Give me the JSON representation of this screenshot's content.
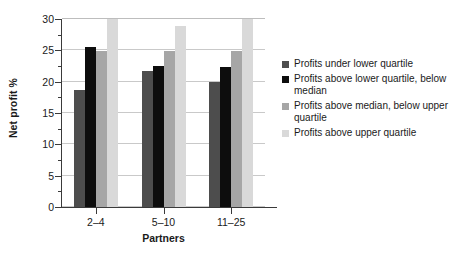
{
  "chart_data": {
    "type": "bar",
    "title": "",
    "subtitle": "",
    "xlabel": "Partners",
    "ylabel": "Net profit %",
    "categories": [
      "2–4",
      "5–10",
      "11–25"
    ],
    "ylim": [
      0,
      30
    ],
    "yticks": [
      0,
      5,
      10,
      15,
      20,
      25,
      30
    ],
    "ytick_labels": [
      "0",
      "5",
      "10",
      "15",
      "20",
      "25",
      "30"
    ],
    "yminor_ticks": [
      2.5,
      7.5,
      12.5,
      17.5,
      22.5,
      27.5
    ],
    "grid": true,
    "grid_axis": "y",
    "legend_position": "right",
    "series": [
      {
        "name": "Profits under lower quartile",
        "color": "#4d4d4d",
        "values": [
          18.6,
          21.7,
          19.9
        ],
        "clipped": [
          false,
          false,
          false
        ]
      },
      {
        "name": "Profits above lower quartile, below median",
        "color": "#0d0d0d",
        "values": [
          25.6,
          22.5,
          22.4
        ],
        "clipped": [
          false,
          false,
          false
        ]
      },
      {
        "name": "Profits above median, below upper quartile",
        "color": "#a6a6a6",
        "values": [
          24.9,
          24.9,
          24.9
        ],
        "clipped": [
          false,
          false,
          false
        ]
      },
      {
        "name": "Profits above upper quartile",
        "color": "#d9d9d9",
        "values": [
          30.0,
          28.9,
          30.0
        ],
        "clipped": [
          true,
          false,
          true
        ]
      }
    ]
  },
  "legend": {
    "entries": [
      {
        "label": "Profits under lower quartile",
        "color": "#4d4d4d"
      },
      {
        "label": "Profits above lower quartile, below median",
        "color": "#0d0d0d"
      },
      {
        "label": "Profits above median, below upper quartile",
        "color": "#a6a6a6"
      },
      {
        "label": "Profits above upper quartile",
        "color": "#d9d9d9"
      }
    ]
  }
}
